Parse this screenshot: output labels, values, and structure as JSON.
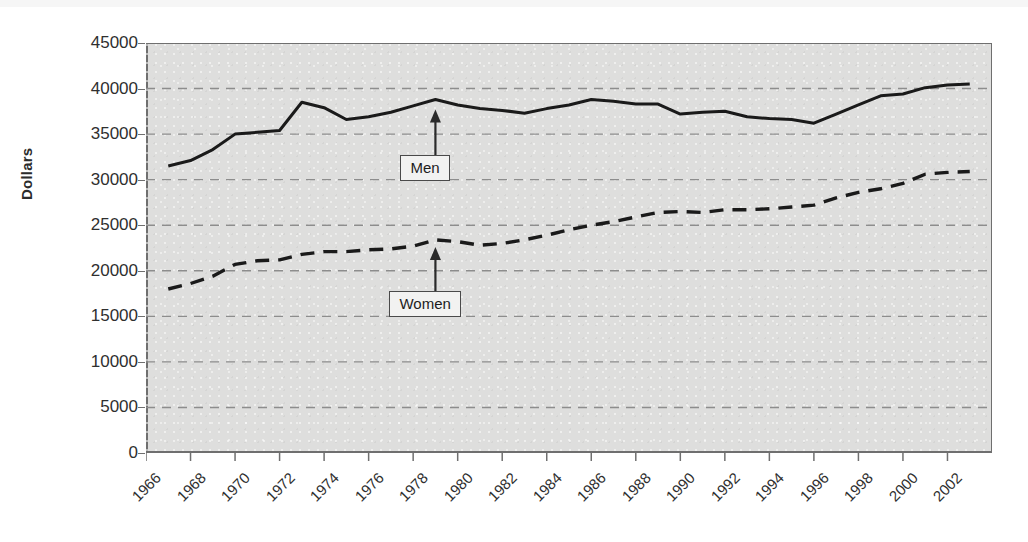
{
  "chart_data": {
    "type": "line",
    "title": "",
    "subtitle": "",
    "xlabel": "",
    "ylabel": "Dollars",
    "xlim": [
      1966,
      2004
    ],
    "ylim": [
      0,
      45000
    ],
    "grid": true,
    "grid_style": "dashed-horizontal",
    "legend_position": "inline-annotations",
    "x_tick_labels": [
      "1966",
      "1968",
      "1970",
      "1972",
      "1974",
      "1976",
      "1978",
      "1980",
      "1982",
      "1984",
      "1986",
      "1988",
      "1990",
      "1992",
      "1994",
      "1996",
      "1998",
      "2000",
      "2002"
    ],
    "y_tick_labels": [
      "0",
      "5000",
      "10000",
      "15000",
      "20000",
      "25000",
      "30000",
      "35000",
      "40000",
      "45000"
    ],
    "y_tick_values": [
      0,
      5000,
      10000,
      15000,
      20000,
      25000,
      30000,
      35000,
      40000,
      45000
    ],
    "x": [
      1967,
      1968,
      1969,
      1970,
      1971,
      1972,
      1973,
      1974,
      1975,
      1976,
      1977,
      1978,
      1979,
      1980,
      1981,
      1982,
      1983,
      1984,
      1985,
      1986,
      1987,
      1988,
      1989,
      1990,
      1991,
      1992,
      1993,
      1994,
      1995,
      1996,
      1997,
      1998,
      1999,
      2000,
      2001,
      2002,
      2003
    ],
    "series": [
      {
        "name": "Men",
        "line_style": "solid",
        "color": "#1a1a1a",
        "values": [
          31500,
          32100,
          33300,
          35000,
          35200,
          35400,
          38500,
          37900,
          36600,
          36900,
          37400,
          38100,
          38800,
          38200,
          37800,
          37600,
          37300,
          37800,
          38200,
          38800,
          38600,
          38300,
          38300,
          37200,
          37400,
          37500,
          36900,
          36700,
          36600,
          36200,
          37200,
          38200,
          39200,
          39400,
          40100,
          40400,
          40500
        ]
      },
      {
        "name": "Women",
        "line_style": "dashed",
        "color": "#1a1a1a",
        "values": [
          18000,
          18600,
          19400,
          20700,
          21100,
          21200,
          21800,
          22100,
          22100,
          22300,
          22400,
          22700,
          23400,
          23200,
          22800,
          23000,
          23400,
          23900,
          24500,
          25000,
          25400,
          25900,
          26400,
          26500,
          26400,
          26700,
          26700,
          26800,
          27000,
          27200,
          28000,
          28600,
          29000,
          29600,
          30600,
          30800,
          30900
        ]
      }
    ],
    "annotations": [
      {
        "name": "men-annotation",
        "label": "Men",
        "points_to_series": "Men",
        "points_to_x": 1979
      },
      {
        "name": "women-annotation",
        "label": "Women",
        "points_to_series": "Women",
        "points_to_x": 1979
      }
    ]
  },
  "colors": {
    "plot_background": "#dededd",
    "page_background": "#ffffff",
    "axis": "#6f6f6f",
    "gridline": "#8d8d8d",
    "line": "#1a1a1a",
    "text": "#2f2f2f"
  }
}
